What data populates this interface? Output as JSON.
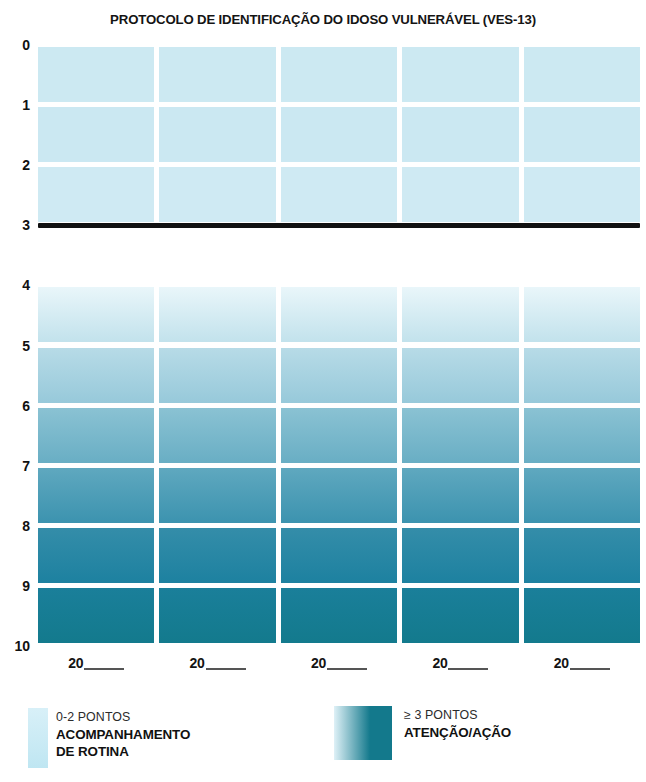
{
  "header": {
    "title": "PROTOCOLO DE IDENTIFICAÇÃO DO IDOSO VULNERÁVEL (VES-13)"
  },
  "chart_data": {
    "type": "heatmap",
    "title": "PROTOCOLO DE IDENTIFICAÇÃO DO IDOSO VULNERÁVEL (VES-13)",
    "xlabel": "",
    "ylabel": "",
    "ylim": [
      0,
      10
    ],
    "yaxis_inverted": true,
    "grid": true,
    "legend_position": "bottom",
    "y_ticks": [
      "0",
      "1",
      "2",
      "3",
      "4",
      "5",
      "6",
      "7",
      "8",
      "9",
      "10"
    ],
    "x_ticks": [
      "20____",
      "20____",
      "20____",
      "20____",
      "20____"
    ],
    "x_tick_prefix": "20",
    "columns": 5,
    "annotations": [
      {
        "name": "threshold-line",
        "value": 3,
        "label": "",
        "color": "#111111"
      }
    ],
    "bands": [
      {
        "name": "low-risk-band",
        "range": [
          0,
          3
        ],
        "rows": [
          {
            "from": 0,
            "to": 1,
            "color": "#cce9f2"
          },
          {
            "from": 1,
            "to": 2,
            "color": "#cbe8f2"
          },
          {
            "from": 2,
            "to": 3,
            "color": "#cfeaf3"
          }
        ]
      },
      {
        "name": "high-risk-band",
        "range": [
          4,
          10
        ],
        "gradient_from": "#eaf7fb",
        "gradient_to": "#157a8c",
        "rows": [
          {
            "from": 4,
            "to": 5,
            "color_top": "#e9f6fa",
            "color_bottom": "#c2e2ec"
          },
          {
            "from": 5,
            "to": 6,
            "color_top": "#b7dbe7",
            "color_bottom": "#97c9da"
          },
          {
            "from": 6,
            "to": 7,
            "color_top": "#8ac2d3",
            "color_bottom": "#69aec4"
          },
          {
            "from": 7,
            "to": 8,
            "color_top": "#5fa8bf",
            "color_bottom": "#3c93af"
          },
          {
            "from": 8,
            "to": 9,
            "color_top": "#348da9",
            "color_bottom": "#1d81a0"
          },
          {
            "from": 9,
            "to": 10,
            "color_top": "#1a7f9a",
            "color_bottom": "#137a8d"
          }
        ]
      }
    ]
  },
  "legend": {
    "items": [
      {
        "swatch_name": "legend-swatch-low",
        "swatch_color_top": "#d8f0f8",
        "swatch_color_bottom": "#bfe6f2",
        "line1": "0-2 PONTOS",
        "line2": "ACOMPANHAMENTO",
        "line3": "DE ROTINA"
      },
      {
        "swatch_name": "legend-swatch-high",
        "swatch_color_left": "#dff1f7",
        "swatch_color_right": "#13798c",
        "line1": "≥ 3 PONTOS",
        "line2": "ATENÇÃO/AÇÃO",
        "line3": ""
      }
    ]
  },
  "colors": {
    "light_blue": "#cce9f2",
    "dark_teal": "#137a8d",
    "threshold_black": "#111111",
    "background": "#ffffff"
  }
}
